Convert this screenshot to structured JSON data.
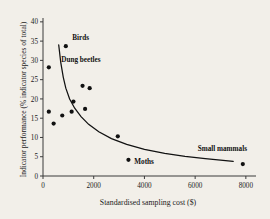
{
  "chart_data": {
    "type": "scatter",
    "title": "",
    "xlabel": "Standardised sampling cost ($)",
    "ylabel": "Indicator performance (% indicator species of total)",
    "xlim": [
      0,
      8400
    ],
    "ylim": [
      0,
      41
    ],
    "xticks": [
      0,
      2000,
      4000,
      6000,
      8000
    ],
    "xtick_labels": [
      "0",
      "2000",
      "4000",
      "6000",
      "8000"
    ],
    "yticks": [
      0,
      5,
      10,
      15,
      20,
      25,
      30,
      35,
      40
    ],
    "ytick_labels": [
      "0",
      "5",
      "10",
      "15",
      "20",
      "25",
      "30",
      "35",
      "40"
    ],
    "grid": false,
    "legend": "none",
    "marker": "filled-circle",
    "marker_color": "#111111",
    "points": [
      {
        "x": 230,
        "y": 28.2
      },
      {
        "x": 230,
        "y": 16.7
      },
      {
        "x": 420,
        "y": 13.6
      },
      {
        "x": 760,
        "y": 15.7
      },
      {
        "x": 900,
        "y": 33.7,
        "label": "Birds"
      },
      {
        "x": 1130,
        "y": 16.7
      },
      {
        "x": 1200,
        "y": 19.3
      },
      {
        "x": 1560,
        "y": 23.4
      },
      {
        "x": 1660,
        "y": 17.4
      },
      {
        "x": 1840,
        "y": 22.8
      },
      {
        "x": 2950,
        "y": 10.3
      },
      {
        "x": 3370,
        "y": 4.2,
        "label": "Moths"
      },
      {
        "x": 7880,
        "y": 3.1,
        "label": "Small mammals"
      }
    ],
    "fit_curve": {
      "type": "power-decay",
      "description": "fitted declining curve through the scatter",
      "x_range": [
        620,
        7500
      ],
      "points": [
        {
          "x": 620,
          "y": 34.0
        },
        {
          "x": 700,
          "y": 29.5
        },
        {
          "x": 800,
          "y": 25.6
        },
        {
          "x": 900,
          "y": 22.8
        },
        {
          "x": 1050,
          "y": 20.0
        },
        {
          "x": 1250,
          "y": 17.6
        },
        {
          "x": 1500,
          "y": 15.4
        },
        {
          "x": 1800,
          "y": 13.4
        },
        {
          "x": 2200,
          "y": 11.5
        },
        {
          "x": 2700,
          "y": 9.7
        },
        {
          "x": 3300,
          "y": 8.2
        },
        {
          "x": 4000,
          "y": 6.9
        },
        {
          "x": 4800,
          "y": 5.9
        },
        {
          "x": 5600,
          "y": 5.1
        },
        {
          "x": 6400,
          "y": 4.5
        },
        {
          "x": 7000,
          "y": 4.1
        },
        {
          "x": 7500,
          "y": 3.8
        }
      ]
    },
    "annotations": [
      {
        "text": "Birds",
        "x": 1150,
        "y": 35.3
      },
      {
        "text": "Dung beetles",
        "x": 720,
        "y": 29.5
      },
      {
        "text": "Moths",
        "x": 3600,
        "y": 3.2
      },
      {
        "text": "Small mammals",
        "x": 6100,
        "y": 6.4
      }
    ]
  }
}
